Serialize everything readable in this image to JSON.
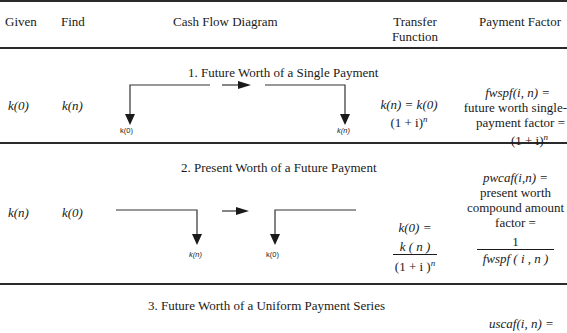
{
  "header": {
    "given": "Given",
    "find": "Find",
    "diagram": "Cash Flow Diagram",
    "transfer_line1": "Transfer",
    "transfer_line2": "Function",
    "payment": "Payment Factor"
  },
  "rows": [
    {
      "title": "1. Future Worth of a Single Payment",
      "given": "k(0)",
      "find": "k(n)",
      "diagram_labels": {
        "left": "k(0)",
        "right": "k(n)"
      },
      "transfer_line1": "k(n) = k(0)",
      "transfer_line2": "(1 + i)",
      "transfer_exp": "n",
      "factor_line1": "fwspf(i, n) =",
      "factor_line2": "future worth single-",
      "factor_line3": "payment factor =",
      "factor_line4": "(1 + i)",
      "factor_exp": "n"
    },
    {
      "title": "2. Present Worth of a Future Payment",
      "given": "k(n)",
      "find": "k(0)",
      "diagram_labels": {
        "left": "k(n)",
        "right": "k(0)"
      },
      "transfer_line1": "k(0) =",
      "transfer_num": "k ( n )",
      "transfer_den": "(1 + i )",
      "transfer_exp": "n",
      "factor_line1": "pwcaf(i,n) =",
      "factor_line2": "present worth",
      "factor_line3": "compound amount",
      "factor_line4": "factor =",
      "factor_num": "1",
      "factor_den": "fwspf ( i , n )"
    },
    {
      "title": "3. Future Worth of a Uniform Payment Series",
      "factor_line1": "uscaf(i, n) ="
    }
  ],
  "colors": {
    "rule": "#2a2a2a",
    "text": "#1a1a1a",
    "background": "#ffffff"
  }
}
